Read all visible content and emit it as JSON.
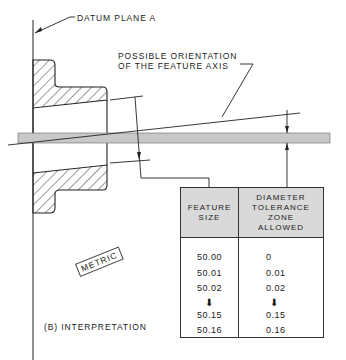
{
  "diagram": {
    "labels": {
      "datum_plane": "DATUM PLANE A",
      "orientation_line1": "POSSIBLE ORIENTATION",
      "orientation_line2": "OF THE FEATURE AXIS",
      "metric": "METRIC",
      "caption": "(B) INTERPRETATION"
    },
    "table": {
      "headers": {
        "feature_size": [
          "FEATURE",
          "SIZE"
        ],
        "tolerance": [
          "DIAMETER",
          "TOLERANCE",
          "ZONE",
          "ALLOWED"
        ]
      },
      "rows": [
        {
          "feature_size": "50.00",
          "tolerance": "0"
        },
        {
          "feature_size": "50.01",
          "tolerance": "0.01"
        },
        {
          "feature_size": "50.02",
          "tolerance": "0.02"
        },
        {
          "feature_size": "50.15",
          "tolerance": "0.15"
        },
        {
          "feature_size": "50.16",
          "tolerance": "0.16"
        }
      ],
      "continuation_arrow": "⬇"
    },
    "colors": {
      "line": "#222222",
      "tolerance_band": "#c8c8c8",
      "table_header": "#d9d9d9"
    }
  }
}
